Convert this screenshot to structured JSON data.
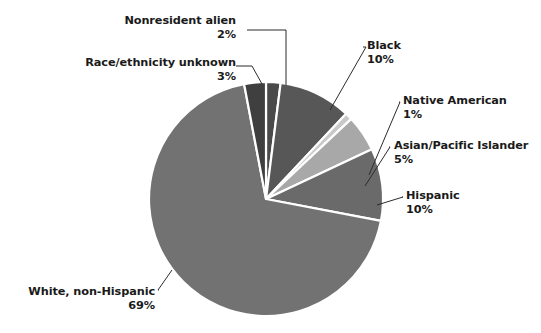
{
  "chart_data": {
    "type": "pie",
    "title": "",
    "subtitle": "",
    "xlabel": "",
    "ylabel": "",
    "legend_position": "none",
    "grid": false,
    "labels_show_percent": true,
    "start_angle_deg": 0,
    "direction": "clockwise",
    "categories": [
      "Nonresident alien",
      "Black",
      "Native American",
      "Asian/Pacific Islander",
      "Hispanic",
      "White, non-Hispanic",
      "Race/ethnicity unknown"
    ],
    "values": [
      2,
      10,
      1,
      5,
      10,
      69,
      3
    ],
    "value_labels": [
      "2%",
      "10%",
      "1%",
      "5%",
      "10%",
      "69%",
      "3%"
    ],
    "colors": [
      "#4a4a4a",
      "#575757",
      "#c9c9c9",
      "#a8a8a8",
      "#6a6a6a",
      "#727272",
      "#3f3f3f"
    ],
    "slice_border_color": "#ffffff",
    "slices": [
      {
        "name": "Nonresident alien",
        "value": 2,
        "percent_label": "2%",
        "color": "#4a4a4a",
        "label_align": "right",
        "label_x": 36,
        "label_y": 14
      },
      {
        "name": "Black",
        "value": 10,
        "percent_label": "10%",
        "color": "#575757",
        "label_align": "left",
        "label_x": 367,
        "label_y": 39
      },
      {
        "name": "Native American",
        "value": 1,
        "percent_label": "1%",
        "color": "#c9c9c9",
        "label_align": "left",
        "label_x": 403,
        "label_y": 94
      },
      {
        "name": "Asian/Pacific Islander",
        "value": 5,
        "percent_label": "5%",
        "color": "#a8a8a8",
        "label_align": "left",
        "label_x": 394,
        "label_y": 139
      },
      {
        "name": "Hispanic",
        "value": 10,
        "percent_label": "10%",
        "color": "#6a6a6a",
        "label_align": "left",
        "label_x": 406,
        "label_y": 189
      },
      {
        "name": "White, non-Hispanic",
        "value": 69,
        "percent_label": "69%",
        "color": "#727272",
        "label_align": "right",
        "label_x": 27,
        "label_y": 285
      },
      {
        "name": "Race/ethnicity unknown",
        "value": 3,
        "percent_label": "3%",
        "color": "#3f3f3f",
        "label_align": "right",
        "label_x": 8,
        "label_y": 56
      }
    ],
    "geometry": {
      "center_x": 266,
      "center_y": 199,
      "radius": 117
    }
  }
}
